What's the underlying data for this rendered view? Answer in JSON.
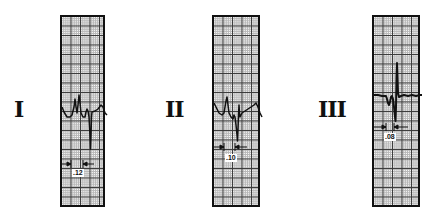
{
  "figure": {
    "leads": [
      {
        "label": "I",
        "qrs_duration": ".12",
        "label_x": 14,
        "strip_left": 60,
        "strip_width": 45
      },
      {
        "label": "II",
        "qrs_duration": ".10",
        "label_x": 165,
        "strip_left": 212,
        "strip_width": 48
      },
      {
        "label": "III",
        "qrs_duration": ".08",
        "label_x": 318,
        "strip_left": 372,
        "strip_width": 48
      }
    ],
    "colors": {
      "trace": "#111111",
      "grid_major": "#3a3a3a",
      "grid_minor": "#b8b8b8",
      "border": "#111111",
      "background": "#ffffff"
    }
  }
}
